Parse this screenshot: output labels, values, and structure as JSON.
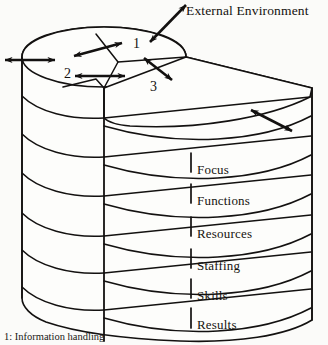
{
  "figure": {
    "title": "External Environment",
    "caption": "1: Information handling",
    "ink_color": "#131110",
    "background_color": "#fbfbf9"
  },
  "top_surface": {
    "sectors": [
      {
        "number": "1",
        "x": 133,
        "y": 37
      },
      {
        "number": "2",
        "x": 64,
        "y": 67
      },
      {
        "number": "3",
        "x": 150,
        "y": 80
      }
    ]
  },
  "stack": {
    "layers": [
      {
        "label": "Focus",
        "x": 197,
        "y": 163
      },
      {
        "label": "Functions",
        "x": 197,
        "y": 194
      },
      {
        "label": "Resources",
        "x": 197,
        "y": 227
      },
      {
        "label": "Staffing",
        "x": 197,
        "y": 259
      },
      {
        "label": "Skills",
        "x": 197,
        "y": 289
      },
      {
        "label": "Results",
        "x": 197,
        "y": 318
      }
    ]
  }
}
